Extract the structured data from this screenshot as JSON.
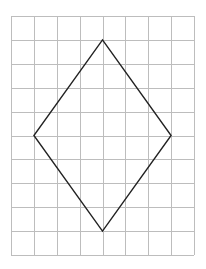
{
  "figure": {
    "background_color": "#ffffff"
  },
  "grid": {
    "origin_x": 11,
    "origin_y": 16,
    "width": 183,
    "height": 239,
    "columns": 8,
    "rows": 10,
    "line_color": "#bdbdbd",
    "line_width": 1
  },
  "shape": {
    "type": "rhombus",
    "stroke_color": "#222222",
    "stroke_width": 1.4,
    "fill": "none",
    "vertices_grid": [
      {
        "name": "top",
        "col": 4,
        "row": 1
      },
      {
        "name": "right",
        "col": 7,
        "row": 5
      },
      {
        "name": "bottom",
        "col": 4,
        "row": 9
      },
      {
        "name": "left",
        "col": 1,
        "row": 5
      }
    ],
    "diagonal_horizontal_units": 6,
    "diagonal_vertical_units": 8
  }
}
